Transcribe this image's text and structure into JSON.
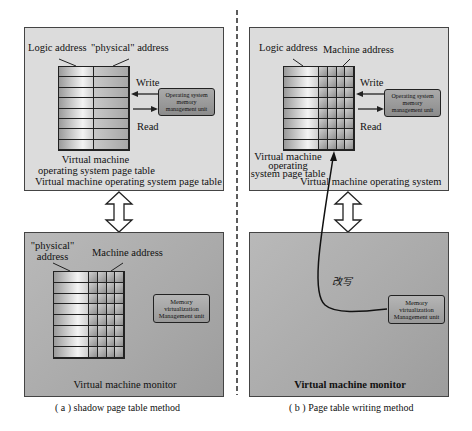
{
  "left_diagram": {
    "caption": "( a ) shadow page table method",
    "guest_panel": {
      "col_label_left": "Logic address",
      "col_label_right": "\"physical\" address",
      "write_label": "Write",
      "read_label": "Read",
      "mmu_label_lines": [
        "Operating system",
        "memory",
        "management unit"
      ],
      "table_label_lines": [
        "Virtual machine",
        "operating system page table"
      ],
      "panel_title": "Virtual machine operating system page table",
      "table_rows": 8
    },
    "monitor_panel": {
      "col_label_left_lines": [
        "\"physical\"",
        "address"
      ],
      "col_label_right": "Machine address",
      "unit_label_lines": [
        "Memory",
        "virtualization",
        "Management unit"
      ],
      "panel_title": "Virtual machine monitor",
      "table_rows": 8,
      "grid_columns": 4
    }
  },
  "right_diagram": {
    "caption": "( b ) Page table writing method",
    "guest_panel": {
      "col_label_left": "Logic address",
      "col_label_right": "Machine address",
      "write_label": "Write",
      "read_label": "Read",
      "mmu_label_lines": [
        "Operating system",
        "memory",
        "management unit"
      ],
      "table_label_lines": [
        "Virtual machine",
        "operating",
        "system page table"
      ],
      "panel_title": "Virtual machine operating system",
      "table_rows": 8,
      "grid_columns": 4
    },
    "monitor_panel": {
      "rewrite_label": "改写",
      "unit_label_lines": [
        "Memory",
        "virtualization",
        "Management unit"
      ],
      "panel_title": "Virtual machine monitor"
    }
  },
  "colors": {
    "top_panel_bg": "#dcdcdc",
    "bottom_panel_bg": "#a9a9a9",
    "stroke": "#222222"
  }
}
